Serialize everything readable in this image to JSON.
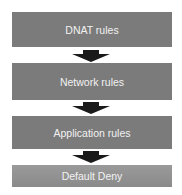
{
  "diagram": {
    "type": "flowchart",
    "direction": "top-to-bottom",
    "steps": [
      {
        "label": "DNAT rules"
      },
      {
        "label": "Network rules"
      },
      {
        "label": "Application rules"
      },
      {
        "label": "Default Deny"
      }
    ],
    "colors": {
      "box": "#7b7b7b",
      "final_box": "#929292",
      "text": "#f2f2f2",
      "arrow": "#1a1a1a"
    }
  }
}
